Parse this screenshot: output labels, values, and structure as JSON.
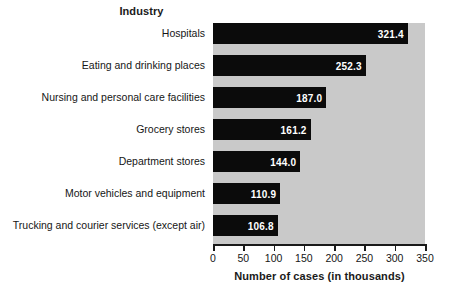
{
  "chart_data": {
    "type": "bar",
    "orientation": "horizontal",
    "title": "Industry",
    "xlabel": "Number of cases (in thousands)",
    "ylabel": "",
    "xlim": [
      0,
      350
    ],
    "xticks": [
      "0",
      "50",
      "100",
      "150",
      "200",
      "250",
      "300",
      "350"
    ],
    "grid": false,
    "legend": null,
    "categories": [
      "Hospitals",
      "Eating and drinking places",
      "Nursing and personal care facilities",
      "Grocery stores",
      "Department stores",
      "Motor vehicles and equipment",
      "Trucking and courier services (except air)"
    ],
    "values": [
      321.4,
      252.3,
      187.0,
      161.2,
      144.0,
      110.9,
      106.8
    ],
    "value_labels": [
      "321.4",
      "252.3",
      "187.0",
      "161.2",
      "144.0",
      "110.9",
      "106.8"
    ],
    "colors": {
      "bar": "#0b0b0b",
      "plot_background": "#c9c9c9",
      "page_background": "#ffffff",
      "value_label": "#ffffff",
      "axis": "#1a1a1a",
      "text": "#161616"
    }
  }
}
